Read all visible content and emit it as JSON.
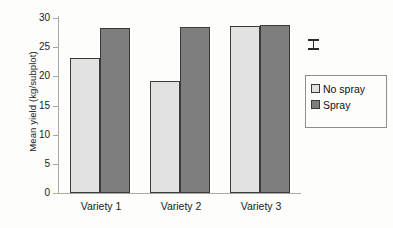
{
  "chart_data": {
    "type": "bar",
    "title": "",
    "xlabel": "",
    "ylabel": "Mean yield (kg/subplot)",
    "categories": [
      "Variety 1",
      "Variety 2",
      "Variety 3"
    ],
    "series": [
      {
        "name": "No spray",
        "color": "#e2e2e2",
        "values": [
          22.8,
          19.0,
          28.3
        ]
      },
      {
        "name": "Spray",
        "color": "#7e7e7e",
        "values": [
          28.0,
          28.1,
          28.4
        ]
      }
    ],
    "ylim": [
      0,
      30
    ],
    "yticks": [
      0,
      5,
      10,
      15,
      20,
      25,
      30
    ],
    "ytick_labels": [
      "0",
      "5",
      "10",
      "15",
      "20",
      "25",
      "30"
    ],
    "grid": false,
    "legend_position": "right",
    "annotations": [
      {
        "type": "error-bar",
        "name": "lsd-error-bar",
        "center_value": 25.2,
        "half_range": 0.9
      }
    ]
  },
  "legend": {
    "entries": [
      {
        "label": "No spray",
        "swatch": "legend-swatch-no-spray"
      },
      {
        "label": "Spray",
        "swatch": "legend-swatch-spray"
      }
    ]
  }
}
